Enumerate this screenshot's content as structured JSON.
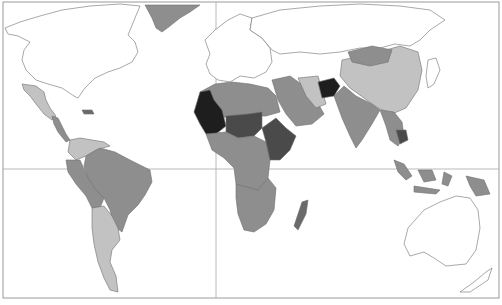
{
  "map": {
    "type": "choropleth",
    "projection": "world",
    "style": "grayscale",
    "frame": {
      "x": 3,
      "y": 2,
      "width": 496,
      "height": 296
    },
    "gridlines": {
      "equator_y": 169,
      "prime_meridian_x": 216
    },
    "legend": null,
    "title": null,
    "shade_levels": {
      "none": "#ffffff",
      "level1": "#c2c2c2",
      "level2": "#8e8e8e",
      "level3": "#6a6a6a",
      "level4": "#4a4a4a",
      "level5": "#1e1e1e"
    },
    "colors": {
      "background": "#ffffff",
      "outline": "#7a7a7a",
      "frame": "#9a9a9a"
    },
    "regions": [
      {
        "name": "north-america",
        "shade": "none"
      },
      {
        "name": "greenland",
        "shade": "level2"
      },
      {
        "name": "mexico",
        "shade": "level1"
      },
      {
        "name": "central-america",
        "shade": "level2"
      },
      {
        "name": "caribbean",
        "shade": "level3"
      },
      {
        "name": "south-america-north",
        "shade": "level1"
      },
      {
        "name": "brazil",
        "shade": "level2"
      },
      {
        "name": "peru-bolivia",
        "shade": "level2"
      },
      {
        "name": "argentina-chile",
        "shade": "level1"
      },
      {
        "name": "europe",
        "shade": "none"
      },
      {
        "name": "russia",
        "shade": "none"
      },
      {
        "name": "north-africa",
        "shade": "level2"
      },
      {
        "name": "west-africa",
        "shade": "level5"
      },
      {
        "name": "sahel",
        "shade": "level4"
      },
      {
        "name": "central-africa",
        "shade": "level2"
      },
      {
        "name": "east-africa",
        "shade": "level4"
      },
      {
        "name": "southern-africa",
        "shade": "level2"
      },
      {
        "name": "madagascar",
        "shade": "level3"
      },
      {
        "name": "middle-east",
        "shade": "level2"
      },
      {
        "name": "iran",
        "shade": "level1"
      },
      {
        "name": "afghanistan",
        "shade": "level5"
      },
      {
        "name": "south-asia",
        "shade": "level2"
      },
      {
        "name": "china",
        "shade": "level1"
      },
      {
        "name": "mongolia",
        "shade": "level2"
      },
      {
        "name": "southeast-asia",
        "shade": "level2"
      },
      {
        "name": "cambodia",
        "shade": "level4"
      },
      {
        "name": "indonesia",
        "shade": "level2"
      },
      {
        "name": "australia",
        "shade": "none"
      },
      {
        "name": "new-zealand",
        "shade": "none"
      },
      {
        "name": "japan",
        "shade": "none"
      }
    ]
  }
}
